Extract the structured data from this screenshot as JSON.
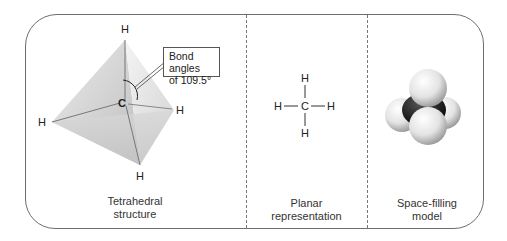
{
  "panels": [
    {
      "id": "tetrahedral",
      "label_line1": "Tetrahedral",
      "label_line2": "structure",
      "atoms": {
        "top": "H",
        "center": "C",
        "left": "H",
        "right": "H",
        "bottom": "H"
      },
      "callout": {
        "line1": "Bond angles",
        "line2": "of 109.5°"
      }
    },
    {
      "id": "planar",
      "label_line1": "Planar",
      "label_line2": "representation",
      "atoms": {
        "top": "H",
        "center": "C",
        "left": "H",
        "right": "H",
        "bottom": "H"
      }
    },
    {
      "id": "space-filling",
      "label_line1": "Space-filling",
      "label_line2": "model"
    }
  ],
  "colors": {
    "border": "#6e6e6e",
    "carbon": "#1a1a1a",
    "hydrogen": "#e6e6e6",
    "tetra_face": "#c8c8c8"
  }
}
